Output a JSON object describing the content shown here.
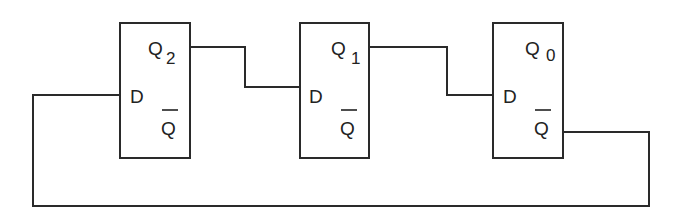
{
  "diagram": {
    "type": "circuit",
    "stroke_color": "#2a2a2a",
    "flip_flops": [
      {
        "id": "ff2",
        "input_label": "D",
        "output_label": "Q",
        "output_subscript": "2",
        "inverted_output_label": "Q"
      },
      {
        "id": "ff1",
        "input_label": "D",
        "output_label": "Q",
        "output_subscript": "1",
        "inverted_output_label": "Q"
      },
      {
        "id": "ff0",
        "input_label": "D",
        "output_label": "Q",
        "output_subscript": "0",
        "inverted_output_label": "Q"
      }
    ],
    "connections": [
      {
        "from": "Q2",
        "to": "D (ff1)"
      },
      {
        "from": "Q1",
        "to": "D (ff0)"
      },
      {
        "from": "Q0-bar",
        "to": "D (ff2)"
      }
    ]
  }
}
